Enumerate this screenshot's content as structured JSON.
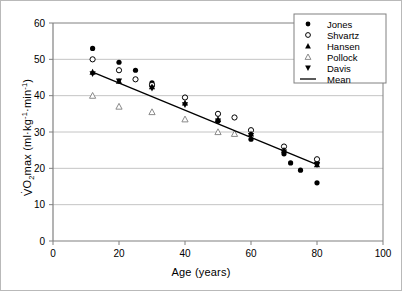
{
  "chart_data": {
    "type": "scatter",
    "title": "",
    "xlabel": "Age (years)",
    "ylabel": "VO2max (ml·kg-1·min-1)",
    "xlim": [
      0,
      100
    ],
    "ylim": [
      0,
      60
    ],
    "xticks": [
      0,
      20,
      40,
      60,
      80,
      100
    ],
    "yticks": [
      0,
      10,
      20,
      30,
      40,
      50,
      60
    ],
    "grid": "horizontal",
    "legend_position": "top-right",
    "series": [
      {
        "name": "Jones",
        "marker": "filled-circle",
        "color": "#000000",
        "points": [
          [
            12,
            53.0
          ],
          [
            20,
            49.2
          ],
          [
            25,
            47.0
          ],
          [
            30,
            43.5
          ],
          [
            40,
            39.5
          ],
          [
            50,
            33.0
          ],
          [
            60,
            28.0
          ],
          [
            70,
            24.0
          ],
          [
            72,
            21.5
          ],
          [
            75,
            19.5
          ],
          [
            80,
            21.5
          ],
          [
            80,
            16.0
          ]
        ]
      },
      {
        "name": "Shvartz",
        "marker": "open-circle",
        "color": "#000000",
        "points": [
          [
            12,
            50.0
          ],
          [
            20,
            47.0
          ],
          [
            25,
            44.5
          ],
          [
            30,
            43.0
          ],
          [
            40,
            39.5
          ],
          [
            50,
            35.0
          ],
          [
            55,
            34.0
          ],
          [
            60,
            30.5
          ],
          [
            70,
            26.0
          ],
          [
            80,
            22.5
          ]
        ]
      },
      {
        "name": "Hansen",
        "marker": "filled-triangle-up",
        "color": "#000000",
        "points": [
          [
            12,
            46.5
          ],
          [
            20,
            44.0
          ],
          [
            30,
            42.5
          ],
          [
            40,
            38.0
          ],
          [
            50,
            33.5
          ],
          [
            60,
            29.5
          ],
          [
            70,
            25.0
          ],
          [
            80,
            21.0
          ]
        ]
      },
      {
        "name": "Pollock",
        "marker": "open-triangle-up",
        "color": "#8a8a8a",
        "points": [
          [
            12,
            40.0
          ],
          [
            20,
            37.0
          ],
          [
            30,
            35.5
          ],
          [
            40,
            33.5
          ],
          [
            50,
            30.0
          ],
          [
            55,
            29.5
          ]
        ]
      },
      {
        "name": "Davis",
        "marker": "filled-triangle-down",
        "color": "#000000",
        "points": [
          [
            12,
            46.0
          ],
          [
            20,
            44.0
          ],
          [
            30,
            42.0
          ],
          [
            40,
            37.5
          ],
          [
            50,
            33.0
          ],
          [
            60,
            29.0
          ],
          [
            70,
            24.5
          ],
          [
            80,
            21.0
          ]
        ]
      }
    ],
    "fit_line": {
      "name": "Mean",
      "style": "solid",
      "color": "#000000",
      "x0": 12,
      "y0": 46.5,
      "x1": 80,
      "y1": 21.0
    }
  },
  "legend": {
    "entries": [
      {
        "label": "Jones",
        "marker": "filled-circle"
      },
      {
        "label": "Shvartz",
        "marker": "open-circle"
      },
      {
        "label": "Hansen",
        "marker": "filled-triangle-up"
      },
      {
        "label": "Pollock",
        "marker": "open-triangle-up"
      },
      {
        "label": "Davis",
        "marker": "filled-triangle-down"
      },
      {
        "label": "Mean",
        "marker": "line"
      }
    ]
  },
  "axes": {
    "x_title": "Age (years)",
    "y_title_prefix": "O",
    "y_title_sub": "2",
    "y_title_mid": "max (ml·kg",
    "y_title_sup1": "-1",
    "y_title_mid2": "·min",
    "y_title_sup2": "-1",
    "y_title_close": ")",
    "x_tick_labels": [
      "0",
      "20",
      "40",
      "60",
      "80",
      "100"
    ],
    "y_tick_labels": [
      "0",
      "10",
      "20",
      "30",
      "40",
      "50",
      "60"
    ]
  },
  "style": {
    "axis_color": "#808080",
    "grid_color": "#c4c4c4",
    "marker_color": "#000000",
    "open_marker_color": "#8a8a8a",
    "border_color": "#b9b9b9"
  }
}
